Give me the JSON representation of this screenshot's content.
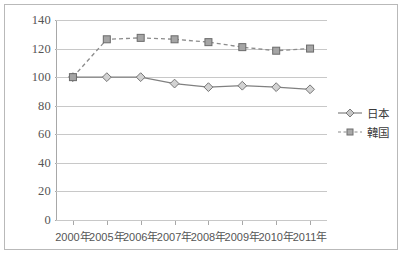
{
  "chart_data": {
    "type": "line",
    "title": "",
    "xlabel": "",
    "ylabel": "",
    "categories": [
      "2000年",
      "2005年",
      "2006年",
      "2007年",
      "2008年",
      "2009年",
      "2010年",
      "2011年"
    ],
    "yticks": [
      0,
      20,
      40,
      60,
      80,
      100,
      120,
      140
    ],
    "ylim": [
      0,
      140
    ],
    "grid": true,
    "legend_position": "right",
    "series": [
      {
        "name": "日本",
        "marker": "diamond",
        "line_style": "solid",
        "color": "#808080",
        "values": [
          100,
          100,
          100,
          95.5,
          93,
          94,
          93,
          91.5
        ]
      },
      {
        "name": "韓国",
        "marker": "square",
        "line_style": "dashed",
        "color": "#8c8c8c",
        "values": [
          100,
          126.5,
          127.5,
          126.5,
          124.5,
          121,
          118.5,
          120
        ]
      }
    ]
  },
  "legend": {
    "items": [
      {
        "label": "日本"
      },
      {
        "label": "韓国"
      }
    ]
  }
}
